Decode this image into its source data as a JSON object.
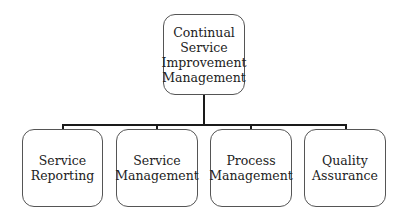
{
  "diagram": {
    "type": "org-chart",
    "root": {
      "id": "root",
      "label": "Continual\nService\nImprovement\nManagement"
    },
    "children": [
      {
        "id": "c1",
        "label": "Service\nReporting"
      },
      {
        "id": "c2",
        "label": "Service\nManagement"
      },
      {
        "id": "c3",
        "label": "Process\nManagement"
      },
      {
        "id": "c4",
        "label": "Quality\nAssurance"
      }
    ],
    "edges": [
      {
        "from": "root",
        "to": "c1"
      },
      {
        "from": "root",
        "to": "c2"
      },
      {
        "from": "root",
        "to": "c3"
      },
      {
        "from": "root",
        "to": "c4"
      }
    ],
    "colors": {
      "line": "#1a1a1a",
      "box_border": "#555555",
      "text": "#222222",
      "background": "#ffffff"
    }
  }
}
